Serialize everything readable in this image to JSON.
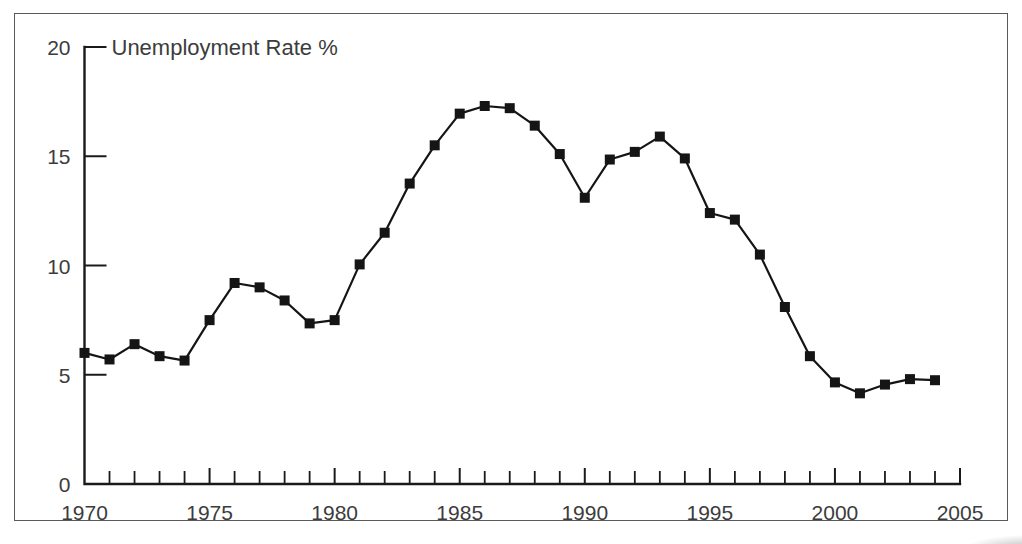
{
  "figure": {
    "name": "unemployment-rate-line-chart",
    "background_color": "#ffffff",
    "frame_color": "#5a5a5a",
    "ink_color": "#151515",
    "label_color": "#3c3c3c"
  },
  "chart_data": {
    "type": "line",
    "title": "Unemployment Rate %",
    "xlabel": "",
    "ylabel": "",
    "xlim": [
      1970,
      2005
    ],
    "ylim": [
      0,
      20
    ],
    "grid": false,
    "legend": null,
    "x_tick_labels": [
      "1970",
      "1975",
      "1980",
      "1985",
      "1990",
      "1995",
      "2000",
      "2005"
    ],
    "x_major_ticks": [
      1970,
      1975,
      1980,
      1985,
      1990,
      1995,
      2000,
      2005
    ],
    "x_minor_tick_step": 1,
    "y_tick_labels": [
      "0",
      "5",
      "10",
      "15",
      "20"
    ],
    "y_major_ticks": [
      0,
      5,
      10,
      15,
      20
    ],
    "marker": "square",
    "x": [
      1970,
      1971,
      1972,
      1973,
      1974,
      1975,
      1976,
      1977,
      1978,
      1979,
      1980,
      1981,
      1982,
      1983,
      1984,
      1985,
      1986,
      1987,
      1988,
      1989,
      1990,
      1991,
      1992,
      1993,
      1994,
      1995,
      1996,
      1997,
      1998,
      1999,
      2000,
      2001,
      2002,
      2003,
      2004
    ],
    "values": [
      6.0,
      5.7,
      6.4,
      5.85,
      5.65,
      7.5,
      9.2,
      9.0,
      8.4,
      7.35,
      7.5,
      10.05,
      11.5,
      13.75,
      15.5,
      16.95,
      17.3,
      17.2,
      16.4,
      15.1,
      13.1,
      14.85,
      15.2,
      15.9,
      14.9,
      12.4,
      12.1,
      10.5,
      8.1,
      5.85,
      4.65,
      4.15,
      4.55,
      4.8,
      4.75
    ],
    "series": [
      {
        "name": "Unemployment Rate %",
        "values": [
          6.0,
          5.7,
          6.4,
          5.85,
          5.65,
          7.5,
          9.2,
          9.0,
          8.4,
          7.35,
          7.5,
          10.05,
          11.5,
          13.75,
          15.5,
          16.95,
          17.3,
          17.2,
          16.4,
          15.1,
          13.1,
          14.85,
          15.2,
          15.9,
          14.9,
          12.4,
          12.1,
          10.5,
          8.1,
          5.85,
          4.65,
          4.15,
          4.55,
          4.8,
          4.75
        ]
      }
    ]
  }
}
